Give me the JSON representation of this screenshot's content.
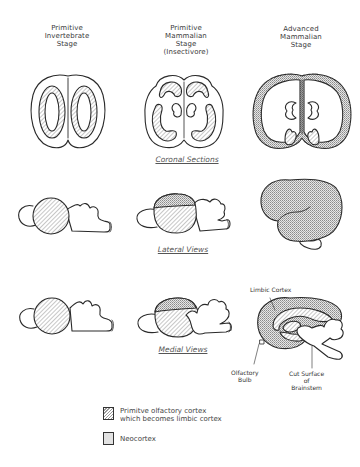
{
  "figure": {
    "columns": [
      {
        "id": "invertebrate",
        "lines": [
          "Primitive",
          "Invertebrate",
          "Stage"
        ]
      },
      {
        "id": "primitive-mammalian",
        "lines": [
          "Primitive",
          "Mammalian",
          "Stage",
          "(Insectivore)"
        ]
      },
      {
        "id": "advanced-mammalian",
        "lines": [
          "Advanced",
          "Mammalian",
          "Stage"
        ]
      }
    ],
    "rows": [
      {
        "id": "coronal",
        "label": "Coronal Sections"
      },
      {
        "id": "lateral",
        "label": "Lateral Views"
      },
      {
        "id": "medial",
        "label": "Medial Views"
      }
    ],
    "annotations": {
      "limbic_cortex": "Limbic Cortex",
      "olfactory_bulb": [
        "Olfactory",
        "Bulb"
      ],
      "cut_surface": [
        "Cut Surface",
        "of",
        "Brainstem"
      ]
    },
    "legend": [
      {
        "pattern": "hatched",
        "lines": [
          "Primitve olfactory cortex",
          "which becomes limbic cortex"
        ]
      },
      {
        "pattern": "stippled",
        "lines": [
          "Neocortex"
        ]
      }
    ],
    "colors": {
      "ink": "#2a2a2a",
      "paper": "#ffffff",
      "hatch": "#9a9a9a",
      "stipple": "#b5b5b5"
    }
  }
}
